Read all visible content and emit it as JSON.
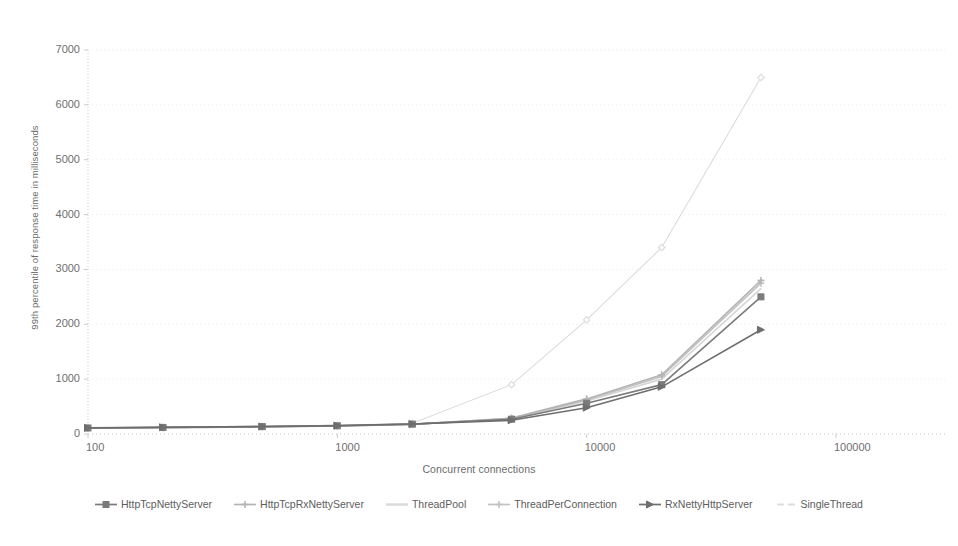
{
  "chart_data": {
    "type": "line",
    "title": "",
    "xlabel": "Concurrent connections",
    "ylabel": "99th percentile of response time in milliseconds",
    "xscale": "log",
    "yscale": "linear",
    "xlim": [
      100,
      100000
    ],
    "ylim": [
      0,
      7000
    ],
    "grid": true,
    "legend_position": "bottom",
    "x_tick_labels": [
      "100",
      "1000",
      "10000",
      "100000"
    ],
    "x_tick_values": [
      100,
      1000,
      10000,
      100000
    ],
    "y_tick_labels": [
      "0",
      "1000",
      "2000",
      "3000",
      "4000",
      "5000",
      "6000",
      "7000"
    ],
    "y_tick_values": [
      0,
      1000,
      2000,
      3000,
      4000,
      5000,
      6000,
      7000
    ],
    "x": [
      100,
      200,
      500,
      1000,
      2000,
      5000,
      10000,
      20000,
      50000
    ],
    "series": [
      {
        "name": "HttpTcpNettyServer",
        "color": "#7b7b7b",
        "marker": "square",
        "values": [
          110,
          120,
          135,
          150,
          180,
          270,
          560,
          900,
          2500
        ]
      },
      {
        "name": "HttpTcpRxNettyServer",
        "color": "#b4b4b4",
        "marker": "plus",
        "values": [
          105,
          115,
          130,
          145,
          175,
          290,
          640,
          1080,
          2800
        ]
      },
      {
        "name": "ThreadPool",
        "color": "#d6d6d6",
        "marker": "none",
        "values": [
          108,
          118,
          132,
          148,
          178,
          280,
          600,
          1000,
          2650
        ]
      },
      {
        "name": "ThreadPerConnection",
        "color": "#c2c2c2",
        "marker": "plus",
        "values": [
          106,
          116,
          131,
          147,
          176,
          285,
          620,
          1050,
          2750
        ]
      },
      {
        "name": "RxNettyHttpServer",
        "color": "#6e6e6e",
        "marker": "triangle",
        "values": [
          112,
          122,
          136,
          152,
          182,
          250,
          480,
          860,
          1900
        ]
      },
      {
        "name": "SingleThread",
        "color": "#dcdcdc",
        "marker": "diamond",
        "values": [
          112,
          124,
          140,
          158,
          195,
          900,
          2080,
          3400,
          6500
        ]
      }
    ]
  },
  "axes": {
    "x_title": "Concurrent connections",
    "y_title": "99th percentile of response time in milliseconds"
  },
  "legend": {
    "items": [
      {
        "label": "HttpTcpNettyServer",
        "color": "#7b7b7b",
        "marker": "square"
      },
      {
        "label": "HttpTcpRxNettyServer",
        "color": "#b4b4b4",
        "marker": "plus"
      },
      {
        "label": "ThreadPool",
        "color": "#d9d9d9",
        "marker": "none"
      },
      {
        "label": "ThreadPerConnection",
        "color": "#c2c2c2",
        "marker": "plus"
      },
      {
        "label": "RxNettyHttpServer",
        "color": "#6e6e6e",
        "marker": "triangle"
      },
      {
        "label": "SingleThread",
        "color": "#dcdcdc",
        "marker": "dash"
      }
    ]
  },
  "colors": {
    "background": "#ffffff",
    "gridline": "#ededed",
    "axis": "#cccccc",
    "text": "#6f6f6f"
  }
}
